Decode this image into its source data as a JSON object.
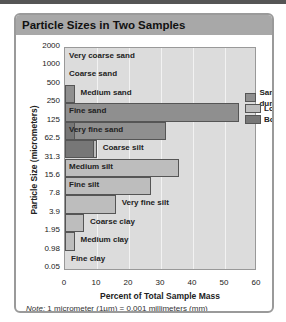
{
  "title": "Particle Sizes in Two Samples",
  "colors": {
    "sand_dune": "#8f8f8f",
    "loess": "#bdbdbd",
    "both": "#777777",
    "plot_bg": "#dcdcdc",
    "header_bg": "#a8a8a8"
  },
  "legend": [
    "Sand dune",
    "Loess",
    "Both"
  ],
  "yticks": [
    "2000",
    "1000",
    "500",
    "250",
    "125",
    "62.5",
    "31.3",
    "15.6",
    "7.8",
    "3.9",
    "1.95",
    "0.98",
    "0.05"
  ],
  "xticks": [
    "0",
    "10",
    "20",
    "30",
    "40",
    "50",
    "60"
  ],
  "xlabel": "Percent of Total Sample Mass",
  "ylabel": "Particle Size (micrometers)",
  "note_label": "Note:",
  "note_text": "1 micrometer (1µm) = 0.001 millimeters (mm)",
  "chart_data": {
    "type": "bar",
    "orientation": "horizontal",
    "title": "Particle Sizes in Two Samples",
    "xlabel": "Percent of Total Sample Mass",
    "ylabel": "Particle Size (micrometers)",
    "xlim": [
      0,
      60
    ],
    "categories": [
      "Very coarse sand",
      "Coarse sand",
      "Medium sand",
      "Fine sand",
      "Very fine sand",
      "Coarse silt",
      "Medium silt",
      "Fine silt",
      "Very fine silt",
      "Coarse clay",
      "Medium clay",
      "Fine clay"
    ],
    "size_ranges_um": [
      "1000-2000",
      "500-1000",
      "250-500",
      "125-250",
      "62.5-125",
      "31.3-62.5",
      "15.6-31.3",
      "7.8-15.6",
      "3.9-7.8",
      "1.95-3.9",
      "0.98-1.95",
      "0.05-0.98"
    ],
    "series": [
      {
        "name": "Sand dune",
        "values": [
          0,
          0,
          3,
          55,
          32,
          9,
          0,
          0,
          0,
          0,
          0,
          0
        ]
      },
      {
        "name": "Loess",
        "values": [
          0,
          0,
          0,
          0,
          3,
          10,
          36,
          27,
          16,
          6,
          3,
          0
        ]
      }
    ],
    "legend": [
      "Sand dune",
      "Loess",
      "Both"
    ],
    "legend_position": "upper right",
    "grid": "vertical",
    "note": "1 micrometer (1µm) = 0.001 millimeters (mm)"
  }
}
